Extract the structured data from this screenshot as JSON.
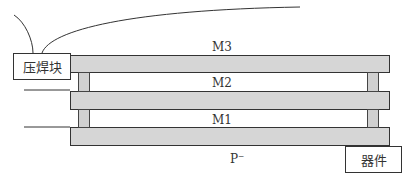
{
  "diagram": {
    "layers": [
      {
        "id": "m3",
        "label": "M3"
      },
      {
        "id": "m2",
        "label": "M2"
      },
      {
        "id": "m1",
        "label": "M1"
      }
    ],
    "substrate_label": "P⁻",
    "bond_pad_label": "压焊块",
    "device_label": "器件",
    "colors": {
      "layer_fill": "#d6d6d6",
      "outline": "#333333",
      "background": "#ffffff"
    }
  }
}
